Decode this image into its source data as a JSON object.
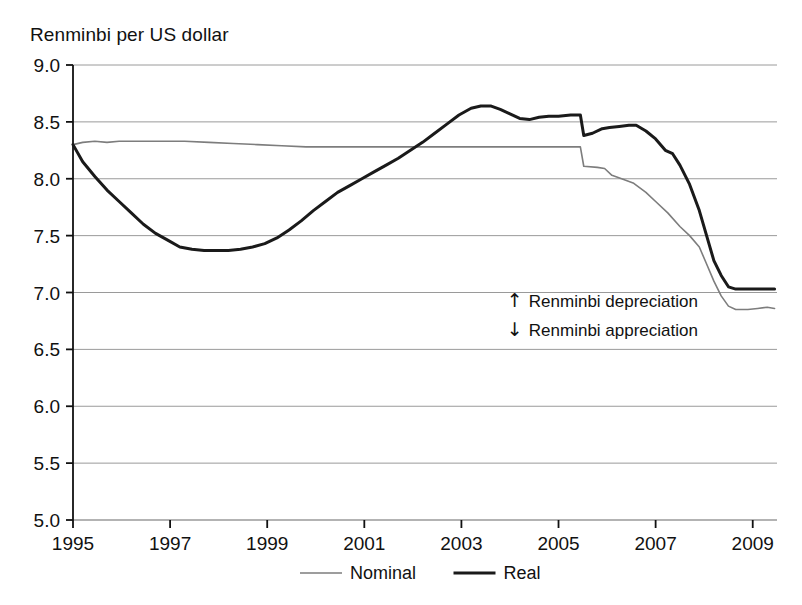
{
  "chart_data": {
    "type": "line",
    "title": "Renminbi per US dollar",
    "xlabel": "",
    "ylabel": "Renminbi per US dollar",
    "xlim": [
      1995,
      2009.5
    ],
    "ylim": [
      5.0,
      9.0
    ],
    "ytick_labels": [
      "9.0",
      "8.5",
      "8.0",
      "7.5",
      "7.0",
      "6.5",
      "6.0",
      "5.5",
      "5.0"
    ],
    "ytick_values": [
      9.0,
      8.5,
      8.0,
      7.5,
      7.0,
      6.5,
      6.0,
      5.5,
      5.0
    ],
    "xtick_labels": [
      "1995",
      "1997",
      "1999",
      "2001",
      "2003",
      "2005",
      "2007",
      "2009"
    ],
    "xtick_values": [
      1995,
      1997,
      1999,
      2001,
      2003,
      2005,
      2007,
      2009
    ],
    "grid": "horizontal",
    "legend_position": "bottom-center",
    "legend": [
      {
        "name": "Nominal",
        "color": "#7d7d7d",
        "width": 1.6
      },
      {
        "name": "Real",
        "color": "#1a1a1a",
        "width": 3.0
      }
    ],
    "annotations": [
      {
        "glyph": "up-arrow",
        "symbol": "↑",
        "text": "Renminbi depreciation",
        "x": 2004.1,
        "y": 6.93
      },
      {
        "glyph": "down-arrow",
        "symbol": "↓",
        "text": "Renminbi appreciation",
        "x": 2004.1,
        "y": 6.68
      }
    ],
    "series": [
      {
        "name": "Nominal",
        "color": "#7d7d7d",
        "points": [
          [
            1995.0,
            8.3
          ],
          [
            1995.2,
            8.32
          ],
          [
            1995.45,
            8.33
          ],
          [
            1995.7,
            8.32
          ],
          [
            1995.95,
            8.33
          ],
          [
            1996.2,
            8.33
          ],
          [
            1996.45,
            8.33
          ],
          [
            1996.7,
            8.33
          ],
          [
            1996.95,
            8.33
          ],
          [
            1997.3,
            8.33
          ],
          [
            1997.8,
            8.32
          ],
          [
            1998.3,
            8.31
          ],
          [
            1998.8,
            8.3
          ],
          [
            1999.3,
            8.29
          ],
          [
            1999.8,
            8.28
          ],
          [
            2000.3,
            8.28
          ],
          [
            2001.0,
            8.28
          ],
          [
            2002.0,
            8.28
          ],
          [
            2003.0,
            8.28
          ],
          [
            2004.0,
            8.28
          ],
          [
            2004.8,
            8.28
          ],
          [
            2005.45,
            8.28
          ],
          [
            2005.52,
            8.11
          ],
          [
            2005.8,
            8.1
          ],
          [
            2005.95,
            8.09
          ],
          [
            2006.1,
            8.03
          ],
          [
            2006.3,
            8.0
          ],
          [
            2006.55,
            7.96
          ],
          [
            2006.8,
            7.88
          ],
          [
            2007.0,
            7.8
          ],
          [
            2007.25,
            7.7
          ],
          [
            2007.5,
            7.58
          ],
          [
            2007.7,
            7.5
          ],
          [
            2007.9,
            7.4
          ],
          [
            2008.05,
            7.25
          ],
          [
            2008.2,
            7.1
          ],
          [
            2008.35,
            6.97
          ],
          [
            2008.5,
            6.88
          ],
          [
            2008.65,
            6.85
          ],
          [
            2008.9,
            6.85
          ],
          [
            2009.1,
            6.86
          ],
          [
            2009.3,
            6.87
          ],
          [
            2009.45,
            6.86
          ]
        ]
      },
      {
        "name": "Real",
        "color": "#1a1a1a",
        "points": [
          [
            1995.0,
            8.3
          ],
          [
            1995.2,
            8.15
          ],
          [
            1995.45,
            8.02
          ],
          [
            1995.7,
            7.9
          ],
          [
            1995.95,
            7.8
          ],
          [
            1996.2,
            7.7
          ],
          [
            1996.45,
            7.6
          ],
          [
            1996.7,
            7.52
          ],
          [
            1996.95,
            7.46
          ],
          [
            1997.2,
            7.4
          ],
          [
            1997.45,
            7.38
          ],
          [
            1997.7,
            7.37
          ],
          [
            1997.95,
            7.37
          ],
          [
            1998.2,
            7.37
          ],
          [
            1998.45,
            7.38
          ],
          [
            1998.7,
            7.4
          ],
          [
            1998.95,
            7.43
          ],
          [
            1999.2,
            7.48
          ],
          [
            1999.45,
            7.55
          ],
          [
            1999.7,
            7.63
          ],
          [
            1999.95,
            7.72
          ],
          [
            2000.2,
            7.8
          ],
          [
            2000.45,
            7.88
          ],
          [
            2000.7,
            7.94
          ],
          [
            2000.95,
            8.0
          ],
          [
            2001.2,
            8.06
          ],
          [
            2001.45,
            8.12
          ],
          [
            2001.7,
            8.18
          ],
          [
            2001.95,
            8.25
          ],
          [
            2002.2,
            8.32
          ],
          [
            2002.45,
            8.4
          ],
          [
            2002.7,
            8.48
          ],
          [
            2002.95,
            8.56
          ],
          [
            2003.2,
            8.62
          ],
          [
            2003.4,
            8.64
          ],
          [
            2003.6,
            8.64
          ],
          [
            2003.8,
            8.61
          ],
          [
            2004.0,
            8.57
          ],
          [
            2004.2,
            8.53
          ],
          [
            2004.4,
            8.52
          ],
          [
            2004.6,
            8.54
          ],
          [
            2004.8,
            8.55
          ],
          [
            2005.0,
            8.55
          ],
          [
            2005.25,
            8.56
          ],
          [
            2005.45,
            8.56
          ],
          [
            2005.52,
            8.38
          ],
          [
            2005.7,
            8.4
          ],
          [
            2005.9,
            8.44
          ],
          [
            2006.05,
            8.45
          ],
          [
            2006.25,
            8.46
          ],
          [
            2006.45,
            8.47
          ],
          [
            2006.6,
            8.47
          ],
          [
            2006.8,
            8.42
          ],
          [
            2007.0,
            8.35
          ],
          [
            2007.2,
            8.25
          ],
          [
            2007.35,
            8.22
          ],
          [
            2007.5,
            8.12
          ],
          [
            2007.7,
            7.95
          ],
          [
            2007.9,
            7.72
          ],
          [
            2008.05,
            7.5
          ],
          [
            2008.2,
            7.28
          ],
          [
            2008.35,
            7.15
          ],
          [
            2008.5,
            7.05
          ],
          [
            2008.65,
            7.03
          ],
          [
            2008.9,
            7.03
          ],
          [
            2009.1,
            7.03
          ],
          [
            2009.3,
            7.03
          ],
          [
            2009.45,
            7.03
          ]
        ]
      }
    ]
  }
}
